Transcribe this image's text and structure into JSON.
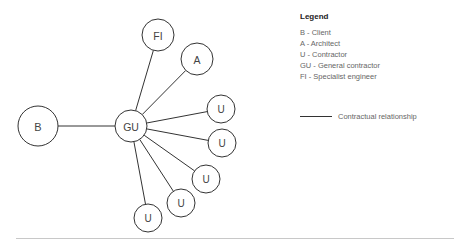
{
  "diagram": {
    "type": "network-star",
    "center_node": "GU",
    "nodes": [
      {
        "id": "B",
        "label": "B",
        "cx": 38,
        "cy": 126,
        "r": 20
      },
      {
        "id": "GU",
        "label": "GU",
        "cx": 131,
        "cy": 126,
        "r": 16
      },
      {
        "id": "FI",
        "label": "FI",
        "cx": 158,
        "cy": 35,
        "r": 16
      },
      {
        "id": "A",
        "label": "A",
        "cx": 197,
        "cy": 59,
        "r": 16
      },
      {
        "id": "U1",
        "label": "U",
        "cx": 221,
        "cy": 109,
        "r": 14
      },
      {
        "id": "U2",
        "label": "U",
        "cx": 222,
        "cy": 143,
        "r": 14
      },
      {
        "id": "U3",
        "label": "U",
        "cx": 206,
        "cy": 179,
        "r": 14
      },
      {
        "id": "U4",
        "label": "U",
        "cx": 181,
        "cy": 203,
        "r": 14
      },
      {
        "id": "U5",
        "label": "U",
        "cx": 148,
        "cy": 218,
        "r": 14
      }
    ],
    "edges": [
      {
        "from": "GU",
        "to": "B"
      },
      {
        "from": "GU",
        "to": "FI"
      },
      {
        "from": "GU",
        "to": "A"
      },
      {
        "from": "GU",
        "to": "U1"
      },
      {
        "from": "GU",
        "to": "U2"
      },
      {
        "from": "GU",
        "to": "U3"
      },
      {
        "from": "GU",
        "to": "U4"
      },
      {
        "from": "GU",
        "to": "U5"
      }
    ],
    "colors": {
      "stroke": "#333333",
      "fill": "#ffffff",
      "text": "#444444"
    }
  },
  "legend": {
    "title": "Legend",
    "items": [
      "B - Client",
      "A - Architect",
      "U - Contractor",
      "GU - General contractor",
      "FI - Specialist engineer"
    ],
    "line_label": "Contractual relationship"
  }
}
